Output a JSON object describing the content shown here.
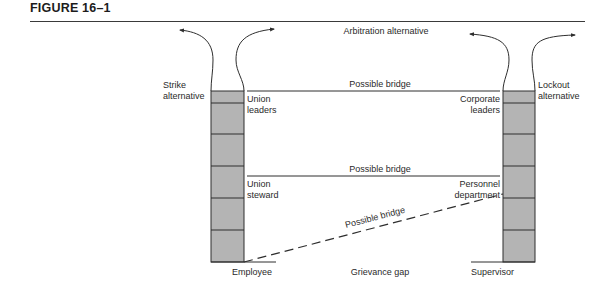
{
  "figure": {
    "title": "FIGURE 16–1"
  },
  "labels": {
    "arbitration": "Arbitration alternative",
    "strike_line1": "Strike",
    "strike_line2": "alternative",
    "lockout_line1": "Lockout",
    "lockout_line2": "alternative",
    "bridge_top": "Possible bridge",
    "bridge_middle": "Possible bridge",
    "bridge_diagonal": "Possible bridge",
    "union_leaders_line1": "Union",
    "union_leaders_line2": "leaders",
    "union_steward_line1": "Union",
    "union_steward_line2": "steward",
    "corporate_leaders_line1": "Corporate",
    "corporate_leaders_line2": "leaders",
    "personnel_line1": "Personnel",
    "personnel_line2": "department",
    "employee": "Employee",
    "grievance_gap": "Grievance gap",
    "supervisor": "Supervisor"
  },
  "colors": {
    "column_fill": "#b4b4b4",
    "line": "#2e2e2e"
  },
  "columns": {
    "left": {
      "name": "union-column",
      "blocks": 6
    },
    "right": {
      "name": "management-column",
      "blocks": 6
    }
  }
}
